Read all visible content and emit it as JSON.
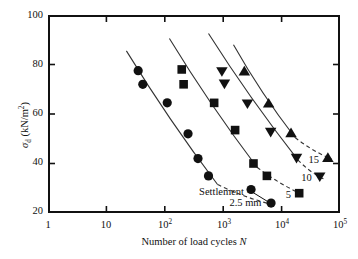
{
  "chart_data": {
    "type": "scatter",
    "title": "",
    "xlabel": "Number of load cycles N",
    "ylabel": "σd (kN/m2)",
    "xscale": "log",
    "yscale": "linear",
    "xlim": [
      1,
      100000
    ],
    "ylim": [
      20,
      100
    ],
    "grid": false,
    "legend_position": "inline-annotations",
    "xticks": [
      "1",
      "10",
      "10^2",
      "10^3",
      "10^4",
      "10^5"
    ],
    "xtick_labels": [
      "1",
      "10",
      "10",
      "10",
      "10",
      "10"
    ],
    "xtick_exponents": [
      "",
      "",
      "2",
      "3",
      "4",
      "5"
    ],
    "yticks": [
      100,
      80,
      60,
      40,
      20
    ],
    "ytick_labels": [
      "100",
      "80",
      "60",
      "40",
      "20"
    ],
    "series": [
      {
        "name": "2.5 mm",
        "marker": "circle",
        "label": "2.5 mm",
        "x": [
          35,
          42,
          110,
          250,
          370,
          560,
          3000,
          6600
        ],
        "y": [
          77.5,
          72.0,
          64.5,
          52.0,
          42.0,
          35.0,
          29.5,
          24.0
        ],
        "fit_solid_x": [
          22,
          800
        ],
        "fit_solid_y": [
          85.5,
          31.5
        ],
        "fit_dashed_x": [
          800,
          7400
        ],
        "fit_dashed_y": [
          31.5,
          23.2
        ]
      },
      {
        "name": "5",
        "marker": "square",
        "label": "5",
        "x": [
          195,
          210,
          700,
          1600,
          3300,
          5600,
          20000
        ],
        "y": [
          78.0,
          72.0,
          64.5,
          53.5,
          40.0,
          35.0,
          28.0
        ],
        "fit_solid_x": [
          120,
          3800
        ],
        "fit_solid_y": [
          90.5,
          38.5
        ],
        "fit_dashed_x": [
          3800,
          23000
        ],
        "fit_dashed_y": [
          38.5,
          27.4
        ]
      },
      {
        "name": "10",
        "marker": "triangle-down",
        "label": "10",
        "x": [
          950,
          1050,
          2600,
          6500,
          18000,
          45000
        ],
        "y": [
          77.0,
          72.0,
          64.0,
          52.5,
          42.0,
          34.5
        ],
        "fit_solid_x": [
          560,
          19000
        ],
        "fit_solid_y": [
          92.5,
          41.5
        ],
        "fit_dashed_x": [
          19000,
          52000
        ],
        "fit_dashed_y": [
          41.5,
          33.8
        ]
      },
      {
        "name": "15",
        "marker": "triangle-up",
        "label": "15",
        "x": [
          2300,
          6000,
          14500,
          62000
        ],
        "y": [
          77.5,
          64.5,
          52.5,
          42.5
        ],
        "fit_solid_x": [
          1500,
          17000
        ],
        "fit_solid_y": [
          88.0,
          50.5
        ],
        "fit_dashed_x": [
          17000,
          72000
        ],
        "fit_dashed_y": [
          50.5,
          41.8
        ]
      }
    ],
    "annotations": [
      {
        "name": "settlement-label-line1",
        "text": "Settlement =",
        "x": 1100,
        "y": 28.5
      },
      {
        "name": "settlement-label-line2",
        "text": "2.5 mm",
        "x": 2400,
        "y": 24.3
      },
      {
        "name": "series-label-5",
        "text": "5",
        "x": 13000,
        "y": 27.5
      },
      {
        "name": "series-label-10",
        "text": "10",
        "x": 27000,
        "y": 34.5
      },
      {
        "name": "series-label-15",
        "text": "15",
        "x": 36000,
        "y": 41.5
      }
    ],
    "leader_line": {
      "name": "settlement-leader",
      "from_x": 2800,
      "from_y": 29.2,
      "to_x": 5800,
      "to_y": 24.6
    }
  },
  "axis": {
    "y_title_sigma": "σ",
    "y_title_sub": "d",
    "y_title_rest": " (kN/m",
    "y_title_sup": "2",
    "y_title_close": ")",
    "x_title_main": "Number of load cycles ",
    "x_title_italic": "N"
  },
  "colors": {
    "axis": "#111111",
    "marker": "#111111",
    "curve": "#333333",
    "background": "#ffffff"
  }
}
